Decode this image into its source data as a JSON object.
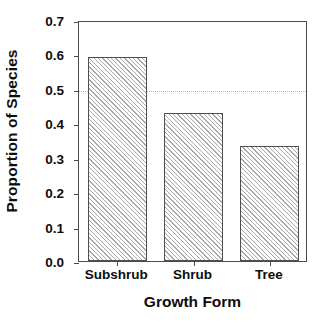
{
  "chart_data": {
    "type": "bar",
    "title": "",
    "xlabel": "Growth Form",
    "ylabel": "Proportion of Species",
    "categories": [
      "Subshrub",
      "Shrub",
      "Tree"
    ],
    "values": [
      0.593,
      0.429,
      0.333
    ],
    "ylim": [
      0.0,
      0.7
    ],
    "xlim_note": "categorical",
    "ytick_labels": [
      "0.0",
      "0.1",
      "0.2",
      "0.3",
      "0.4",
      "0.5",
      "0.6",
      "0.7"
    ],
    "ytick_values": [
      0.0,
      0.1,
      0.2,
      0.3,
      0.4,
      0.5,
      0.6,
      0.7
    ],
    "grid": false,
    "legend": null,
    "annotations": [
      {
        "kind": "horizontal-reference-line",
        "value": 0.5,
        "style": "dotted",
        "color": "#b4b4b4"
      }
    ],
    "bar_style": {
      "fill": "#ffffff",
      "hatch": "diagonal-45",
      "hatch_color": "#a8a8a8",
      "edge_color": "#4f4f4f"
    },
    "axis_color": "#4a4a4a",
    "background": "#ffffff"
  }
}
